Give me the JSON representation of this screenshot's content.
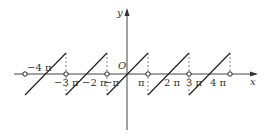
{
  "figure": {
    "type": "sawtooth-function-graph",
    "axes": {
      "x_label": "x",
      "y_label": "y",
      "origin_label": "O"
    },
    "tick_labels": [
      {
        "text": "−4 π",
        "value": "-4pi"
      },
      {
        "text": "−3 π",
        "value": "-3pi"
      },
      {
        "text": "−2 π",
        "value": "-2pi"
      },
      {
        "text": "−π",
        "value": "-pi"
      },
      {
        "text": "π",
        "value": "pi"
      },
      {
        "text": "2 π",
        "value": "2pi"
      },
      {
        "text": "3 π",
        "value": "3pi"
      },
      {
        "text": "4 π",
        "value": "4pi"
      }
    ],
    "period": "2π",
    "jump_points": [
      "-5π",
      "-3π",
      "-π",
      "π",
      "3π",
      "5π"
    ],
    "open_circle_points_on_axis": [
      "-5π",
      "-3π",
      "-π",
      "π",
      "3π",
      "5π"
    ],
    "segments": [
      {
        "from": "-5π",
        "to": "-3π"
      },
      {
        "from": "-3π",
        "to": "-π"
      },
      {
        "from": "-π",
        "to": "π"
      },
      {
        "from": "π",
        "to": "3π"
      },
      {
        "from": "3π",
        "to": "5π"
      }
    ],
    "colors": {
      "line": "#222222",
      "axis": "#444444",
      "dashed": "#666666",
      "background": "#ffffff"
    }
  }
}
